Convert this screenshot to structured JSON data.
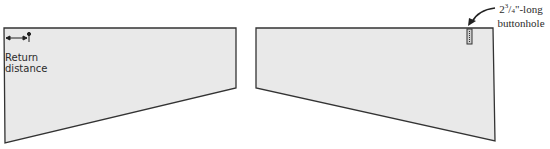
{
  "diagram": {
    "left_panel": {
      "label_line1": "Return",
      "label_line2": "distance",
      "fill": "#e9e9e9",
      "stroke": "#333333"
    },
    "right_panel": {
      "fill": "#e9e9e9",
      "stroke": "#333333"
    },
    "callout": {
      "whole": "2",
      "fraction_num": "3",
      "fraction_den": "4",
      "suffix": "\"-long",
      "line2": "buttonhole"
    }
  }
}
